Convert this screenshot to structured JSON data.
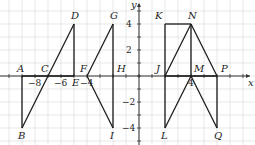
{
  "diagram": {
    "title": "",
    "grid": {
      "unit_px": 13,
      "origin_px": [
        139,
        76
      ],
      "x_range": [
        -10,
        8
      ],
      "y_range": [
        -5,
        5
      ],
      "color": "#d9d9d9"
    },
    "axes": {
      "x_label": "x",
      "y_label": "y",
      "color": "#333333"
    },
    "x_tick_labels": [
      {
        "value": -8,
        "label": "−8"
      },
      {
        "value": -6,
        "label": "−6"
      },
      {
        "value": -4,
        "label": "−4"
      },
      {
        "value": 4,
        "label": "4"
      }
    ],
    "y_tick_labels": [
      {
        "value": 4,
        "label": "4"
      },
      {
        "value": 2,
        "label": "2"
      },
      {
        "value": -2,
        "label": "−2"
      },
      {
        "value": -4,
        "label": "−4"
      }
    ],
    "points": {
      "A": [
        -9,
        0
      ],
      "B": [
        -9,
        -4
      ],
      "C": [
        -7,
        0
      ],
      "D": [
        -5,
        4
      ],
      "E": [
        -5,
        0
      ],
      "F": [
        -4,
        0
      ],
      "G": [
        -2,
        4
      ],
      "H": [
        -2,
        0
      ],
      "I": [
        -2,
        -4
      ],
      "J": [
        2,
        0
      ],
      "K": [
        2,
        4
      ],
      "L": [
        2,
        -4
      ],
      "M": [
        4,
        0
      ],
      "N": [
        4,
        4
      ],
      "P": [
        6,
        0
      ],
      "Q": [
        6,
        -4
      ]
    },
    "segments": [
      [
        "A",
        "B"
      ],
      [
        "B",
        "D"
      ],
      [
        "D",
        "E"
      ],
      [
        "A",
        "E"
      ],
      [
        "F",
        "G"
      ],
      [
        "G",
        "I"
      ],
      [
        "F",
        "I"
      ],
      [
        "K",
        "N"
      ],
      [
        "K",
        "L"
      ],
      [
        "J",
        "N"
      ],
      [
        "N",
        "M"
      ],
      [
        "N",
        "P"
      ],
      [
        "P",
        "Q"
      ],
      [
        "M",
        "L"
      ],
      [
        "M",
        "Q"
      ],
      [
        "J",
        "P"
      ]
    ],
    "label_offsets": {
      "A": [
        -5,
        -4
      ],
      "B": [
        -4,
        11
      ],
      "C": [
        -7,
        -4
      ],
      "D": [
        -3,
        -5
      ],
      "E": [
        -2,
        10
      ],
      "F": [
        -7,
        -4
      ],
      "G": [
        -3,
        -5
      ],
      "H": [
        4,
        -4
      ],
      "I": [
        -3,
        11
      ],
      "J": [
        -9,
        -4
      ],
      "K": [
        -10,
        -5
      ],
      "L": [
        -4,
        11
      ],
      "M": [
        3,
        -4
      ],
      "N": [
        -3,
        -5
      ],
      "P": [
        4,
        -4
      ],
      "Q": [
        -3,
        11
      ]
    },
    "line_color": "#1a1a1a"
  }
}
